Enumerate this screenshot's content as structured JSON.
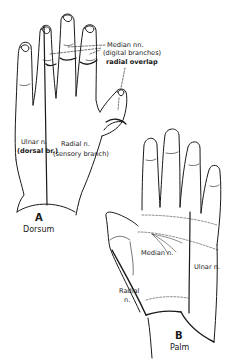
{
  "figure_a": {
    "letter": "A",
    "caption": "Dorsum",
    "labels": {
      "median_line1": "Median nn.",
      "median_line2": "(digital branches)",
      "radial_overlap": "radial overlap",
      "ulnar_line1": "Ulnar n.",
      "ulnar_line2": "(dorsal br.)",
      "radial_line1": "Radial n.",
      "radial_line2": "(sensory branch)"
    }
  },
  "figure_b": {
    "letter": "B",
    "caption": "Palm",
    "labels": {
      "median": "Median n.",
      "ulnar": "Ulnar n.",
      "radial_line1": "Radial",
      "radial_line2": "n."
    }
  },
  "colors": {
    "ink": "#1a1a1a",
    "background": "#ffffff"
  }
}
